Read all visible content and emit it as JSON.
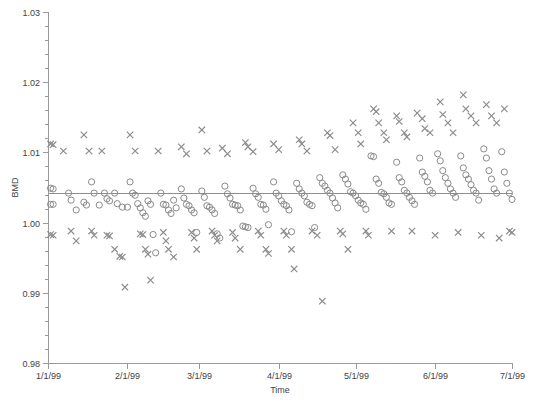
{
  "chart_data": {
    "type": "scatter",
    "title": "",
    "xlabel": "Time",
    "ylabel": "BMD",
    "grid": false,
    "legend_position": "none",
    "xlim": [
      "1/1/99",
      "7/1/99"
    ],
    "ylim": [
      0.98,
      1.03
    ],
    "yticks": [
      "0.98",
      "0.99",
      "1.00",
      "1.01",
      "1.02",
      "1.03"
    ],
    "ytick_values": [
      0.98,
      0.99,
      1.0,
      1.01,
      1.02,
      1.03
    ],
    "yminor_step": 0.002,
    "xticks": [
      "1/1/99",
      "2/1/99",
      "3/1/99",
      "4/1/99",
      "5/1/99",
      "6/1/99",
      "7/1/99"
    ],
    "xtick_days": [
      0,
      31,
      59,
      90,
      120,
      151,
      181
    ],
    "reference_line": {
      "value": 1.0042,
      "label": ""
    },
    "marker_color": "#8a8a8a",
    "axis_color": "#9a9a9a",
    "series": [
      {
        "name": "circle-series",
        "marker": "circle",
        "points": [
          [
            1,
            1.0049
          ],
          [
            2,
            1.0048
          ],
          [
            1,
            1.0026
          ],
          [
            2,
            1.0026
          ],
          [
            8,
            1.0042
          ],
          [
            9,
            1.0032
          ],
          [
            11,
            1.0018
          ],
          [
            14,
            1.0029
          ],
          [
            15,
            1.0025
          ],
          [
            17,
            1.0058
          ],
          [
            18,
            1.0042
          ],
          [
            20,
            1.0025
          ],
          [
            22,
            1.0042
          ],
          [
            23,
            1.0034
          ],
          [
            24,
            1.0031
          ],
          [
            26,
            1.0042
          ],
          [
            27,
            1.0027
          ],
          [
            29,
            1.0022
          ],
          [
            31,
            1.0022
          ],
          [
            32,
            1.0058
          ],
          [
            33,
            1.0042
          ],
          [
            34,
            1.0039
          ],
          [
            35,
            1.0027
          ],
          [
            36,
            1.0021
          ],
          [
            37,
            1.0014
          ],
          [
            38,
            1.0009
          ],
          [
            39,
            1.0031
          ],
          [
            40,
            1.0026
          ],
          [
            41,
            0.9983
          ],
          [
            42,
            0.9957
          ],
          [
            44,
            1.0042
          ],
          [
            45,
            1.0026
          ],
          [
            46,
            1.0025
          ],
          [
            47,
            1.0018
          ],
          [
            48,
            1.0013
          ],
          [
            49,
            1.0032
          ],
          [
            50,
            1.0021
          ],
          [
            52,
            1.0048
          ],
          [
            53,
            1.0035
          ],
          [
            54,
            1.0026
          ],
          [
            55,
            1.0024
          ],
          [
            56,
            1.0018
          ],
          [
            57,
            1.0014
          ],
          [
            58,
            0.9986
          ],
          [
            60,
            1.0045
          ],
          [
            61,
            1.0036
          ],
          [
            62,
            1.0024
          ],
          [
            63,
            1.0022
          ],
          [
            64,
            1.0018
          ],
          [
            65,
            1.0013
          ],
          [
            66,
            0.9984
          ],
          [
            67,
            0.9978
          ],
          [
            69,
            1.0052
          ],
          [
            70,
            1.0041
          ],
          [
            71,
            1.0035
          ],
          [
            72,
            1.0026
          ],
          [
            73,
            1.0025
          ],
          [
            74,
            1.0024
          ],
          [
            75,
            1.0018
          ],
          [
            76,
            0.9995
          ],
          [
            77,
            0.9994
          ],
          [
            78,
            0.9993
          ],
          [
            80,
            1.0049
          ],
          [
            81,
            1.0041
          ],
          [
            82,
            1.0036
          ],
          [
            83,
            1.0026
          ],
          [
            84,
            1.0025
          ],
          [
            85,
            1.0019
          ],
          [
            86,
            0.9997
          ],
          [
            88,
            1.0058
          ],
          [
            89,
            1.0042
          ],
          [
            90,
            1.0038
          ],
          [
            91,
            1.0031
          ],
          [
            92,
            1.0026
          ],
          [
            93,
            1.0024
          ],
          [
            94,
            1.0018
          ],
          [
            95,
            0.9987
          ],
          [
            97,
            1.0056
          ],
          [
            98,
            1.0048
          ],
          [
            99,
            1.0042
          ],
          [
            100,
            1.0038
          ],
          [
            101,
            1.0029
          ],
          [
            102,
            1.0026
          ],
          [
            103,
            1.0024
          ],
          [
            104,
            0.9993
          ],
          [
            106,
            1.0064
          ],
          [
            107,
            1.0056
          ],
          [
            108,
            1.0052
          ],
          [
            109,
            1.0046
          ],
          [
            110,
            1.0042
          ],
          [
            111,
            1.0035
          ],
          [
            112,
            1.0028
          ],
          [
            113,
            1.0021
          ],
          [
            115,
            1.0068
          ],
          [
            116,
            1.0062
          ],
          [
            117,
            1.0055
          ],
          [
            118,
            1.0044
          ],
          [
            119,
            1.0042
          ],
          [
            120,
            1.0038
          ],
          [
            121,
            1.0032
          ],
          [
            122,
            1.0028
          ],
          [
            123,
            1.0026
          ],
          [
            124,
            1.0019
          ],
          [
            126,
            1.0095
          ],
          [
            127,
            1.0094
          ],
          [
            128,
            1.0062
          ],
          [
            129,
            1.0056
          ],
          [
            130,
            1.0043
          ],
          [
            131,
            1.0041
          ],
          [
            132,
            1.0036
          ],
          [
            133,
            1.0028
          ],
          [
            134,
            1.0026
          ],
          [
            136,
            1.0086
          ],
          [
            137,
            1.0064
          ],
          [
            138,
            1.0058
          ],
          [
            139,
            1.0046
          ],
          [
            140,
            1.0042
          ],
          [
            141,
            1.0036
          ],
          [
            142,
            1.0031
          ],
          [
            143,
            1.0026
          ],
          [
            145,
            1.0092
          ],
          [
            146,
            1.0072
          ],
          [
            147,
            1.0066
          ],
          [
            148,
            1.0058
          ],
          [
            149,
            1.0046
          ],
          [
            150,
            1.0042
          ],
          [
            152,
            1.0098
          ],
          [
            153,
            1.0088
          ],
          [
            154,
            1.0074
          ],
          [
            155,
            1.0064
          ],
          [
            156,
            1.0056
          ],
          [
            157,
            1.0048
          ],
          [
            158,
            1.0042
          ],
          [
            159,
            1.0036
          ],
          [
            161,
            1.0095
          ],
          [
            162,
            1.0078
          ],
          [
            163,
            1.0068
          ],
          [
            164,
            1.0062
          ],
          [
            165,
            1.0054
          ],
          [
            166,
            1.0046
          ],
          [
            167,
            1.0042
          ],
          [
            168,
            1.0032
          ],
          [
            170,
            1.0105
          ],
          [
            171,
            1.0092
          ],
          [
            172,
            1.0074
          ],
          [
            173,
            1.0062
          ],
          [
            174,
            1.0048
          ],
          [
            175,
            1.0042
          ],
          [
            177,
            1.0101
          ],
          [
            178,
            1.0072
          ],
          [
            179,
            1.0056
          ],
          [
            180,
            1.0042
          ],
          [
            181,
            1.0033
          ]
        ]
      },
      {
        "name": "x-series",
        "marker": "x",
        "points": [
          [
            1,
            1.0112
          ],
          [
            2,
            1.0111
          ],
          [
            1,
            0.9983
          ],
          [
            2,
            0.9982
          ],
          [
            6,
            1.0102
          ],
          [
            9,
            0.9988
          ],
          [
            11,
            0.9974
          ],
          [
            14,
            1.0125
          ],
          [
            16,
            1.0102
          ],
          [
            17,
            0.9988
          ],
          [
            18,
            0.9982
          ],
          [
            21,
            1.0102
          ],
          [
            23,
            0.9982
          ],
          [
            24,
            0.9981
          ],
          [
            26,
            0.9962
          ],
          [
            28,
            0.9952
          ],
          [
            29,
            0.9951
          ],
          [
            30,
            0.9908
          ],
          [
            32,
            1.0125
          ],
          [
            34,
            1.0102
          ],
          [
            36,
            0.9984
          ],
          [
            37,
            0.9983
          ],
          [
            38,
            0.9962
          ],
          [
            39,
            0.9955
          ],
          [
            40,
            0.9918
          ],
          [
            43,
            1.0102
          ],
          [
            45,
            0.9986
          ],
          [
            46,
            0.9974
          ],
          [
            47,
            0.9962
          ],
          [
            49,
            0.9951
          ],
          [
            52,
            1.0108
          ],
          [
            54,
            1.0098
          ],
          [
            56,
            0.9986
          ],
          [
            57,
            0.9978
          ],
          [
            58,
            0.9962
          ],
          [
            60,
            1.0132
          ],
          [
            62,
            1.0102
          ],
          [
            64,
            0.9988
          ],
          [
            65,
            0.9982
          ],
          [
            66,
            0.9974
          ],
          [
            68,
            1.0106
          ],
          [
            70,
            1.0098
          ],
          [
            72,
            0.9986
          ],
          [
            73,
            0.9978
          ],
          [
            75,
            0.9962
          ],
          [
            77,
            1.0114
          ],
          [
            78,
            1.0108
          ],
          [
            80,
            1.0101
          ],
          [
            82,
            0.9988
          ],
          [
            83,
            0.9982
          ],
          [
            85,
            0.9962
          ],
          [
            86,
            0.9956
          ],
          [
            88,
            1.0112
          ],
          [
            90,
            1.0104
          ],
          [
            92,
            0.9988
          ],
          [
            93,
            0.9982
          ],
          [
            95,
            0.9962
          ],
          [
            96,
            0.9934
          ],
          [
            98,
            1.0118
          ],
          [
            99,
            1.0112
          ],
          [
            101,
            1.0102
          ],
          [
            103,
            0.9988
          ],
          [
            105,
            0.9982
          ],
          [
            107,
            0.9888
          ],
          [
            109,
            1.0128
          ],
          [
            110,
            1.0124
          ],
          [
            112,
            1.0104
          ],
          [
            114,
            0.9988
          ],
          [
            115,
            0.9984
          ],
          [
            117,
            0.9962
          ],
          [
            119,
            1.0142
          ],
          [
            121,
            1.0128
          ],
          [
            122,
            1.0112
          ],
          [
            124,
            0.9988
          ],
          [
            125,
            0.9982
          ],
          [
            127,
            1.0162
          ],
          [
            128,
            1.0158
          ],
          [
            129,
            1.0142
          ],
          [
            131,
            1.0128
          ],
          [
            132,
            1.0118
          ],
          [
            134,
            0.9988
          ],
          [
            136,
            1.0152
          ],
          [
            137,
            1.0144
          ],
          [
            139,
            1.0128
          ],
          [
            140,
            1.0122
          ],
          [
            142,
            0.9988
          ],
          [
            144,
            1.0156
          ],
          [
            146,
            1.0148
          ],
          [
            147,
            1.0134
          ],
          [
            149,
            1.0128
          ],
          [
            151,
            0.9982
          ],
          [
            153,
            1.0172
          ],
          [
            154,
            1.0154
          ],
          [
            156,
            1.0142
          ],
          [
            158,
            1.0128
          ],
          [
            160,
            0.9986
          ],
          [
            162,
            1.0182
          ],
          [
            163,
            1.0162
          ],
          [
            165,
            1.0152
          ],
          [
            167,
            1.0142
          ],
          [
            169,
            0.9982
          ],
          [
            171,
            1.0168
          ],
          [
            173,
            1.0152
          ],
          [
            175,
            1.0142
          ],
          [
            176,
            0.9978
          ],
          [
            178,
            1.0162
          ],
          [
            180,
            0.9988
          ],
          [
            181,
            0.9986
          ]
        ]
      }
    ]
  },
  "caption": {
    "text": ""
  }
}
